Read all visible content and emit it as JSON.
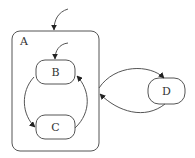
{
  "diagram": {
    "type": "statechart",
    "states": [
      {
        "id": "A",
        "label": "A",
        "kind": "composite"
      },
      {
        "id": "B",
        "label": "B",
        "parent": "A"
      },
      {
        "id": "C",
        "label": "C",
        "parent": "A"
      },
      {
        "id": "D",
        "label": "D"
      }
    ],
    "transitions": [
      {
        "from": "initial",
        "to": "A"
      },
      {
        "from": "initial",
        "to": "B"
      },
      {
        "from": "B",
        "to": "C"
      },
      {
        "from": "C",
        "to": "B"
      },
      {
        "from": "A",
        "to": "D"
      },
      {
        "from": "D",
        "to": "A"
      }
    ],
    "colors": {
      "stroke": "#555555",
      "text": "#333333",
      "background": "#ffffff"
    }
  }
}
